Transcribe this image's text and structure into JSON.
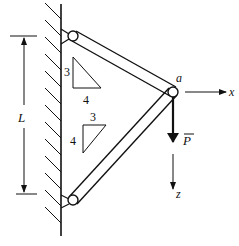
{
  "diagram": {
    "type": "two-bar truss attached to wall",
    "labels": {
      "length": "L",
      "joint": "a",
      "x_axis": "x",
      "z_axis": "z",
      "load": "P"
    },
    "slope_top_bar": {
      "rise": "3",
      "run": "4"
    },
    "slope_bottom_bar": {
      "rise": "3",
      "run": "4"
    },
    "colors": {
      "ink": "#111111",
      "background": "#ffffff"
    }
  }
}
